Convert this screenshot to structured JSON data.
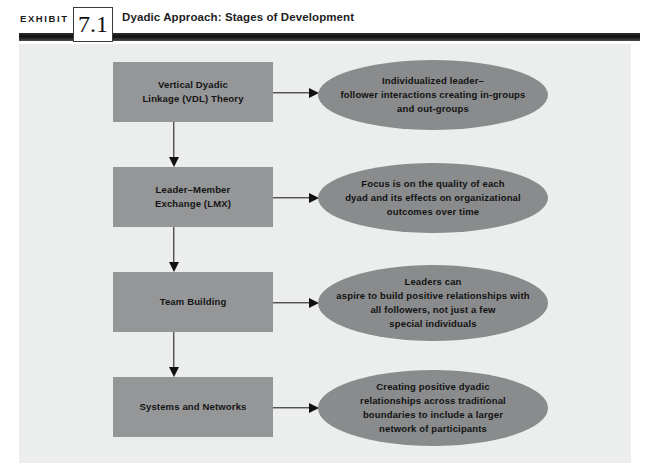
{
  "header": {
    "exhibit_word": "EXHIBIT",
    "exhibit_number": "7.1",
    "title": "Dyadic Approach: Stages of Development"
  },
  "colors": {
    "page_background": "#ffffff",
    "panel_background": "#eceded",
    "box_fill": "#949697",
    "ellipse_fill": "#898b8c",
    "rule_dark": "#111111",
    "text": "#121212"
  },
  "diagram": {
    "type": "flowchart",
    "stages": [
      {
        "stage_label": "Vertical Dyadic\nLinkage (VDL) Theory",
        "outcome_label": "Individualized leader–\nfollower interactions creating in-groups\nand out-groups"
      },
      {
        "stage_label": "Leader–Member\nExchange (LMX)",
        "outcome_label": "Focus is on the quality of each\ndyad and its effects on organizational\noutcomes over time"
      },
      {
        "stage_label": "Team Building",
        "outcome_label": "Leaders can\naspire to build positive relationships with\nall followers, not just a few\nspecial individuals"
      },
      {
        "stage_label": "Systems and Networks",
        "outcome_label": "Creating positive dyadic\nrelationships across traditional\nboundaries to include a larger\nnetwork of participants"
      }
    ]
  }
}
